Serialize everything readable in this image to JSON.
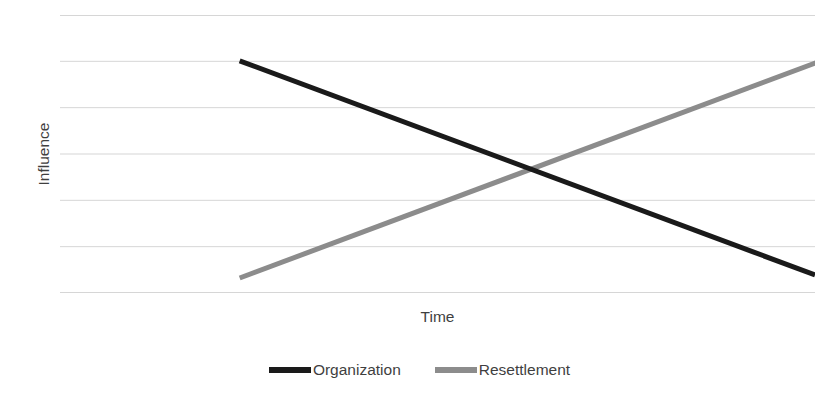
{
  "chart_data": {
    "type": "line",
    "title": "",
    "xlabel": "Time",
    "ylabel": "Influence",
    "grid": true,
    "grid_axis": "y",
    "gridline_count": 7,
    "xlim": [
      0,
      1
    ],
    "ylim": [
      0,
      1
    ],
    "axis_ticks_labeled": false,
    "legend_position": "bottom-center",
    "annotations": [],
    "series": [
      {
        "name": "Organization",
        "color": "#1a1a1a",
        "linewidth": 5,
        "trend": "decreasing",
        "x": [
          0.238,
          1.0
        ],
        "y": [
          0.835,
          0.065
        ],
        "points": [
          {
            "x": 0.238,
            "y": 0.835
          },
          {
            "x": 1.0,
            "y": 0.065
          }
        ]
      },
      {
        "name": "Resettlement",
        "color": "#8c8c8c",
        "linewidth": 5,
        "trend": "increasing",
        "x": [
          0.238,
          1.004
        ],
        "y": [
          0.054,
          0.831
        ],
        "points": [
          {
            "x": 0.238,
            "y": 0.054
          },
          {
            "x": 1.004,
            "y": 0.831
          }
        ]
      }
    ],
    "intersection": {
      "x": 0.62,
      "y": 0.446
    }
  },
  "axes": {
    "y_title": "Influence",
    "x_title": "Time"
  },
  "legend": {
    "items": [
      {
        "label": "Organization",
        "color": "#1a1a1a"
      },
      {
        "label": "Resettlement",
        "color": "#8c8c8c"
      }
    ]
  },
  "colors": {
    "background": "#ffffff",
    "gridline": "#c9c9c9",
    "text": "#3f3f3f",
    "series_organization": "#1a1a1a",
    "series_resettlement": "#8c8c8c"
  }
}
